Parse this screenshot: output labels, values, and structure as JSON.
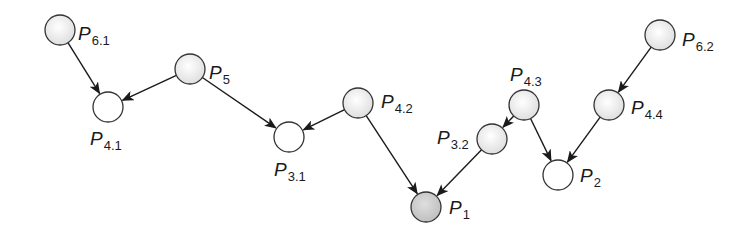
{
  "diagram": {
    "type": "directed-graph",
    "colors": {
      "edge": "#1a1a1a",
      "node_stroke": "#333333",
      "node_fill_light": "#eeeeee",
      "node_fill_white": "#ffffff",
      "node_fill_root": "#cfcfcf"
    },
    "nodes": [
      {
        "id": "P6.1",
        "base": "P",
        "sub": "6.1",
        "cx": 60,
        "cy": 30,
        "fill": "light",
        "lx": 78,
        "ly": 40
      },
      {
        "id": "P4.1",
        "base": "P",
        "sub": "4.1",
        "cx": 108,
        "cy": 107,
        "fill": "white",
        "lx": 90,
        "ly": 145
      },
      {
        "id": "P5",
        "base": "P",
        "sub": "5",
        "cx": 190,
        "cy": 69,
        "fill": "light",
        "lx": 209,
        "ly": 79
      },
      {
        "id": "P3.1",
        "base": "P",
        "sub": "3.1",
        "cx": 289,
        "cy": 137,
        "fill": "white",
        "lx": 274,
        "ly": 176
      },
      {
        "id": "P4.2",
        "base": "P",
        "sub": "4.2",
        "cx": 358,
        "cy": 103,
        "fill": "light",
        "lx": 381,
        "ly": 108
      },
      {
        "id": "P1",
        "base": "P",
        "sub": "1",
        "cx": 426,
        "cy": 207,
        "fill": "root",
        "lx": 449,
        "ly": 214
      },
      {
        "id": "P3.2",
        "base": "P",
        "sub": "3.2",
        "cx": 492,
        "cy": 139,
        "fill": "light",
        "lx": 437,
        "ly": 144
      },
      {
        "id": "P4.3",
        "base": "P",
        "sub": "4.3",
        "cx": 524,
        "cy": 105,
        "fill": "light",
        "lx": 510,
        "ly": 81
      },
      {
        "id": "P2",
        "base": "P",
        "sub": "2",
        "cx": 558,
        "cy": 175,
        "fill": "white",
        "lx": 580,
        "ly": 182
      },
      {
        "id": "P4.4",
        "base": "P",
        "sub": "4.4",
        "cx": 609,
        "cy": 105,
        "fill": "light",
        "lx": 631,
        "ly": 114
      },
      {
        "id": "P6.2",
        "base": "P",
        "sub": "6.2",
        "cx": 660,
        "cy": 35,
        "fill": "light",
        "lx": 682,
        "ly": 46
      }
    ],
    "edges": [
      {
        "from": "P6.1",
        "to": "P4.1"
      },
      {
        "from": "P5",
        "to": "P4.1"
      },
      {
        "from": "P5",
        "to": "P3.1"
      },
      {
        "from": "P4.2",
        "to": "P3.1"
      },
      {
        "from": "P4.2",
        "to": "P1"
      },
      {
        "from": "P3.2",
        "to": "P1"
      },
      {
        "from": "P4.3",
        "to": "P3.2"
      },
      {
        "from": "P4.3",
        "to": "P2"
      },
      {
        "from": "P4.4",
        "to": "P2"
      },
      {
        "from": "P6.2",
        "to": "P4.4"
      }
    ],
    "node_radius": 15
  }
}
